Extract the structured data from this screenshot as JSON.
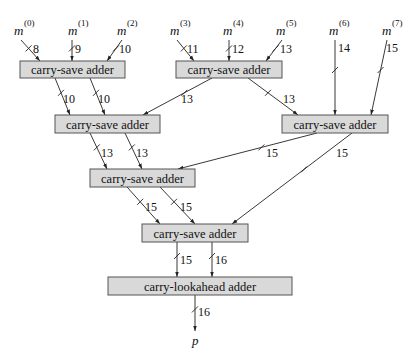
{
  "diagram": {
    "colors": {
      "box_fill": "#d9d9d9",
      "box_stroke": "#555555",
      "line": "#222222"
    },
    "inputs": [
      {
        "var": "m",
        "index": "(0)",
        "x": 14,
        "y": 35,
        "width": "8"
      },
      {
        "var": "m",
        "index": "(1)",
        "x": 68,
        "y": 35,
        "width": "9"
      },
      {
        "var": "m",
        "index": "(2)",
        "x": 117,
        "y": 35,
        "width": "10"
      },
      {
        "var": "m",
        "index": "(3)",
        "x": 170,
        "y": 35,
        "width": "11"
      },
      {
        "var": "m",
        "index": "(4)",
        "x": 223,
        "y": 35,
        "width": "12"
      },
      {
        "var": "m",
        "index": "(5)",
        "x": 276,
        "y": 35,
        "width": "13"
      },
      {
        "var": "m",
        "index": "(6)",
        "x": 329,
        "y": 35,
        "width": "14"
      },
      {
        "var": "m",
        "index": "(7)",
        "x": 382,
        "y": 35,
        "width": "15"
      }
    ],
    "blocks": [
      {
        "id": "csa1",
        "label": "carry-save adder",
        "x": 20,
        "y": 61,
        "w": 105,
        "h": 17
      },
      {
        "id": "csa2",
        "label": "carry-save adder",
        "x": 176,
        "y": 61,
        "w": 106,
        "h": 17
      },
      {
        "id": "csa3",
        "label": "carry-save adder",
        "x": 55,
        "y": 115,
        "w": 105,
        "h": 18
      },
      {
        "id": "csa4",
        "label": "carry-save adder",
        "x": 282,
        "y": 115,
        "w": 106,
        "h": 18
      },
      {
        "id": "csa5",
        "label": "carry-save adder",
        "x": 90,
        "y": 169,
        "w": 105,
        "h": 18
      },
      {
        "id": "csa6",
        "label": "carry-save adder",
        "x": 142,
        "y": 224,
        "w": 106,
        "h": 18
      },
      {
        "id": "cla",
        "label": "carry-lookahead adder",
        "x": 108,
        "y": 277,
        "w": 184,
        "h": 18
      }
    ],
    "edges": [
      {
        "from": [
          21,
          40
        ],
        "to": [
          40,
          61
        ],
        "width": "8",
        "lx": 33,
        "ly": 53
      },
      {
        "from": [
          72,
          40
        ],
        "to": [
          72,
          61
        ],
        "width": "9",
        "lx": 75,
        "ly": 53
      },
      {
        "from": [
          122,
          40
        ],
        "to": [
          107,
          61
        ],
        "width": "10",
        "lx": 119,
        "ly": 53
      },
      {
        "from": [
          177,
          40
        ],
        "to": [
          194,
          61
        ],
        "width": "11",
        "lx": 187,
        "ly": 53
      },
      {
        "from": [
          229,
          40
        ],
        "to": [
          229,
          61
        ],
        "width": "12",
        "lx": 232,
        "ly": 53
      },
      {
        "from": [
          282,
          40
        ],
        "to": [
          266,
          61
        ],
        "width": "13",
        "lx": 280,
        "ly": 53
      },
      {
        "from": [
          335,
          40
        ],
        "to": [
          335,
          115
        ],
        "width": "14",
        "lx": 338,
        "ly": 52
      },
      {
        "from": [
          387,
          40
        ],
        "to": [
          371,
          115
        ],
        "width": "15",
        "lx": 386,
        "ly": 52
      },
      {
        "from": [
          55,
          78
        ],
        "to": [
          70,
          115
        ],
        "width": "10",
        "lx": 63,
        "ly": 103
      },
      {
        "from": [
          90,
          78
        ],
        "to": [
          105,
          115
        ],
        "width": "10",
        "lx": 98,
        "ly": 103
      },
      {
        "from": [
          212,
          78
        ],
        "to": [
          143,
          115
        ],
        "width": "13",
        "lx": 181,
        "ly": 103
      },
      {
        "from": [
          248,
          78
        ],
        "to": [
          298,
          115
        ],
        "width": "13",
        "lx": 283,
        "ly": 103
      },
      {
        "from": [
          90,
          133
        ],
        "to": [
          107,
          169
        ],
        "width": "13",
        "lx": 101,
        "ly": 157
      },
      {
        "from": [
          125,
          133
        ],
        "to": [
          142,
          169
        ],
        "width": "13",
        "lx": 136,
        "ly": 157
      },
      {
        "from": [
          317,
          133
        ],
        "to": [
          178,
          169
        ],
        "width": "15",
        "lx": 266,
        "ly": 157
      },
      {
        "from": [
          352,
          133
        ],
        "to": [
          232,
          224
        ],
        "width": "15",
        "lx": 336,
        "ly": 157
      },
      {
        "from": [
          127,
          187
        ],
        "to": [
          160,
          224
        ],
        "width": "15",
        "lx": 145,
        "ly": 211
      },
      {
        "from": [
          160,
          187
        ],
        "to": [
          195,
          224
        ],
        "width": "15",
        "lx": 180,
        "ly": 211
      },
      {
        "from": [
          177,
          242
        ],
        "to": [
          177,
          277
        ],
        "width": "15",
        "lx": 180,
        "ly": 264
      },
      {
        "from": [
          212,
          242
        ],
        "to": [
          212,
          277
        ],
        "width": "16",
        "lx": 215,
        "ly": 264
      },
      {
        "from": [
          195,
          295
        ],
        "to": [
          195,
          331
        ],
        "width": "16",
        "lx": 198,
        "ly": 316
      }
    ],
    "output": {
      "var": "p",
      "x": 192,
      "y": 345
    }
  }
}
